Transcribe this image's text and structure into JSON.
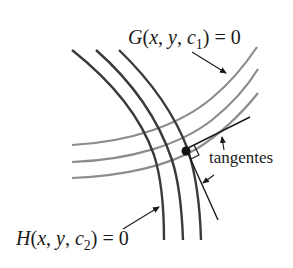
{
  "diagram": {
    "labels": {
      "g_curve": {
        "func": "G",
        "args": [
          "x",
          "y"
        ],
        "param": "c",
        "param_sub": "1",
        "rhs": "0"
      },
      "h_curve": {
        "func": "H",
        "args": [
          "x",
          "y"
        ],
        "param": "c",
        "param_sub": "2",
        "rhs": "0"
      },
      "tangents": "tangentes"
    },
    "colors": {
      "h_curves": "#3a3a3a",
      "g_curves": "#8c8c8c",
      "tangent_lines": "#1a1a1a",
      "point": "#111111",
      "text": "#1a1a1a"
    },
    "families": {
      "G": {
        "count": 3,
        "style": "light-gray"
      },
      "H": {
        "count": 3,
        "style": "dark-gray"
      }
    }
  }
}
